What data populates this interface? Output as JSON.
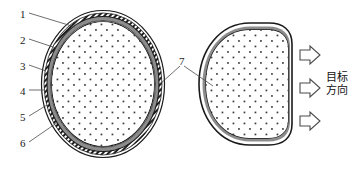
{
  "figure": {
    "type": "technical-cross-section-diagram",
    "background_color": "#ffffff",
    "line_color": "#1a1a1a",
    "gray_layer_color": "#8c8c8c",
    "hatch_layer_color": "#ffffff",
    "core_fill_color": "#ffffff",
    "core_dot_color": "#3a3a3a",
    "arrow_outline_color": "#4a4a4a"
  },
  "left_section": {
    "name": "circular-cross-section",
    "shape": "ellipse",
    "center_x": 103,
    "center_y": 84,
    "radius_x": 62,
    "radius_y": 74,
    "layers": [
      {
        "index": 1,
        "name": "outer-black-line",
        "style": "thin-black-outline"
      },
      {
        "index": 2,
        "name": "hatched-band",
        "style": "diagonal-hatch"
      },
      {
        "index": 3,
        "name": "gray-band",
        "style": "solid-gray"
      },
      {
        "index": 4,
        "name": "inner-white-gap",
        "style": "white"
      },
      {
        "index": 5,
        "name": "inner-black-line",
        "style": "thin-black-outline"
      },
      {
        "index": 6,
        "name": "dotted-core",
        "style": "stippled-fill"
      }
    ]
  },
  "right_section": {
    "name": "deformed-cross-section",
    "shape": "d-shape",
    "description": "flattened right side facing target direction"
  },
  "callouts": [
    {
      "id": "1",
      "label": "1",
      "x": 20,
      "y": 9
    },
    {
      "id": "2",
      "label": "2",
      "x": 20,
      "y": 35
    },
    {
      "id": "3",
      "label": "3",
      "x": 20,
      "y": 61
    },
    {
      "id": "4",
      "label": "4",
      "x": 20,
      "y": 86
    },
    {
      "id": "5",
      "label": "5",
      "x": 20,
      "y": 112
    },
    {
      "id": "6",
      "label": "6",
      "x": 20,
      "y": 138
    },
    {
      "id": "7",
      "label": "7",
      "x": 179,
      "y": 60
    }
  ],
  "arrows": [
    {
      "id": "arrow-top",
      "direction": "right",
      "x": 290,
      "y": 55
    },
    {
      "id": "arrow-middle",
      "direction": "right",
      "x": 290,
      "y": 88
    },
    {
      "id": "arrow-bottom",
      "direction": "right",
      "x": 290,
      "y": 121
    }
  ],
  "annotation": {
    "name": "target-direction-label",
    "line1": "目标",
    "line2": "方向",
    "x": 326,
    "y": 78
  }
}
